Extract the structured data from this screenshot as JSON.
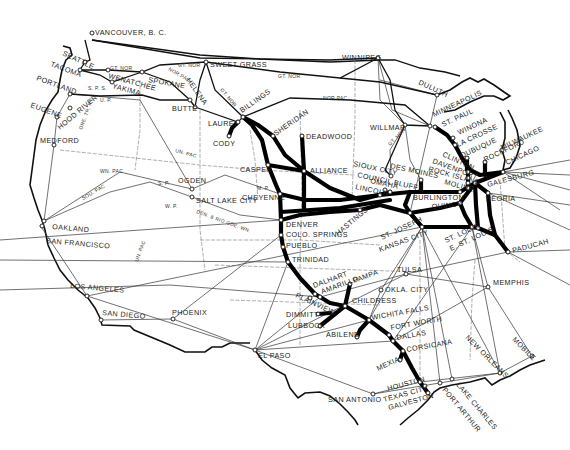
{
  "map": {
    "type": "railroad route map",
    "region": "United States",
    "cities": [
      {
        "id": "vancouver",
        "label": "VANCOUVER, B. C.",
        "x": 92,
        "y": 33,
        "lx": 95,
        "ly": 35,
        "rot": 0
      },
      {
        "id": "seattle",
        "label": "SEATTLE",
        "x": 85,
        "y": 62,
        "lx": 62,
        "ly": 55,
        "rot": 25
      },
      {
        "id": "tacoma",
        "label": "TACOMA",
        "x": 80,
        "y": 70,
        "lx": 50,
        "ly": 66,
        "rot": 20
      },
      {
        "id": "portland",
        "label": "PORTLAND",
        "x": 70,
        "y": 94,
        "lx": 36,
        "ly": 80,
        "rot": 20
      },
      {
        "id": "eugene",
        "label": "EUGENE",
        "x": 57,
        "y": 117,
        "lx": 30,
        "ly": 107,
        "rot": 20
      },
      {
        "id": "hood_river",
        "label": "HOOD RIVER",
        "x": 70,
        "y": 108,
        "lx": 60,
        "ly": 130,
        "rot": -40
      },
      {
        "id": "medford",
        "label": "MEDFORD",
        "x": 54,
        "y": 145,
        "lx": 40,
        "ly": 143,
        "rot": 0
      },
      {
        "id": "wenatchee",
        "label": "WENATCHEE",
        "x": 108,
        "y": 70,
        "lx": 108,
        "ly": 78,
        "rot": 15
      },
      {
        "id": "yakima",
        "label": "YAKIMA",
        "x": 112,
        "y": 82,
        "lx": 112,
        "ly": 88,
        "rot": 15
      },
      {
        "id": "spokane",
        "label": "SPOKANE",
        "x": 142,
        "y": 72,
        "lx": 148,
        "ly": 82,
        "rot": 10
      },
      {
        "id": "helena",
        "label": "HELENA",
        "x": 190,
        "y": 100,
        "lx": 186,
        "ly": 80,
        "rot": 55
      },
      {
        "id": "butte",
        "label": "BUTTE",
        "x": 195,
        "y": 107,
        "lx": 172,
        "ly": 111,
        "rot": 0
      },
      {
        "id": "sweet_grass",
        "label": "SWEET GRASS",
        "x": 206,
        "y": 62,
        "lx": 210,
        "ly": 67,
        "rot": 0
      },
      {
        "id": "billings",
        "label": "BILLINGS",
        "x": 243,
        "y": 117,
        "lx": 242,
        "ly": 113,
        "rot": -35
      },
      {
        "id": "laurel",
        "label": "LAUREL",
        "x": 238,
        "y": 122,
        "lx": 208,
        "ly": 126,
        "rot": 0
      },
      {
        "id": "cody",
        "label": "CODY",
        "x": 229,
        "y": 136,
        "lx": 213,
        "ly": 146,
        "rot": 0
      },
      {
        "id": "sheridan",
        "label": "SHERIDAN",
        "x": 273,
        "y": 136,
        "lx": 276,
        "ly": 136,
        "rot": -35
      },
      {
        "id": "deadwood",
        "label": "DEADWOOD",
        "x": 302,
        "y": 136,
        "lx": 306,
        "ly": 139,
        "rot": 0
      },
      {
        "id": "winnipeg",
        "label": "WINNIPEG",
        "x": 378,
        "y": 58,
        "lx": 342,
        "ly": 60,
        "rot": 0
      },
      {
        "id": "duluth",
        "label": "DULUTH",
        "x": 437,
        "y": 95,
        "lx": 418,
        "ly": 84,
        "rot": 25
      },
      {
        "id": "willmar",
        "label": "WILLMAR",
        "x": 405,
        "y": 125,
        "lx": 370,
        "ly": 130,
        "rot": 0
      },
      {
        "id": "minneapolis",
        "label": "MINNEAPOLIS",
        "x": 430,
        "y": 126,
        "lx": 434,
        "ly": 117,
        "rot": -25
      },
      {
        "id": "st_paul",
        "label": "ST. PAUL",
        "x": 435,
        "y": 127,
        "lx": 443,
        "ly": 127,
        "rot": -25
      },
      {
        "id": "winona",
        "label": "WINONA",
        "x": 453,
        "y": 138,
        "lx": 459,
        "ly": 135,
        "rot": -25
      },
      {
        "id": "la_crosse",
        "label": "LA CROSSE",
        "x": 455,
        "y": 145,
        "lx": 458,
        "ly": 147,
        "rot": -25
      },
      {
        "id": "milwaukee",
        "label": "MILWAUKEE",
        "x": 502,
        "y": 150,
        "lx": 502,
        "ly": 150,
        "rot": -25
      },
      {
        "id": "dubuque",
        "label": "DUBUQUE",
        "x": 467,
        "y": 158,
        "lx": 462,
        "ly": 158,
        "rot": -25
      },
      {
        "id": "rockford",
        "label": "ROCKFORD",
        "x": 485,
        "y": 162,
        "lx": 485,
        "ly": 162,
        "rot": -25
      },
      {
        "id": "chicago",
        "label": "CHICAGO",
        "x": 503,
        "y": 172,
        "lx": 507,
        "ly": 165,
        "rot": -25
      },
      {
        "id": "clinton",
        "label": "CLINTON",
        "x": 468,
        "y": 172,
        "lx": 442,
        "ly": 156,
        "rot": 25
      },
      {
        "id": "davenport",
        "label": "DAVENPORT",
        "x": 468,
        "y": 178,
        "lx": 432,
        "ly": 163,
        "rot": 20
      },
      {
        "id": "rock_island",
        "label": "ROCK ISLAND",
        "x": 468,
        "y": 183,
        "lx": 428,
        "ly": 171,
        "rot": 15
      },
      {
        "id": "moline",
        "label": "MOLINE",
        "x": 468,
        "y": 188,
        "lx": 444,
        "ly": 184,
        "rot": 15
      },
      {
        "id": "galesburg",
        "label": "GALESBURG",
        "x": 475,
        "y": 183,
        "lx": 488,
        "ly": 187,
        "rot": -15
      },
      {
        "id": "peoria",
        "label": "PEORIA",
        "x": 488,
        "y": 193,
        "lx": 486,
        "ly": 201,
        "rot": 0
      },
      {
        "id": "burlington",
        "label": "BURLINGTON",
        "x": 460,
        "y": 192,
        "lx": 413,
        "ly": 200,
        "rot": 0
      },
      {
        "id": "quincy",
        "label": "QUINCY",
        "x": 460,
        "y": 203,
        "lx": 432,
        "ly": 209,
        "rot": -5
      },
      {
        "id": "des_moines",
        "label": "DES MOINES",
        "x": 421,
        "y": 180,
        "lx": 390,
        "ly": 168,
        "rot": 12
      },
      {
        "id": "sioux_city",
        "label": "SIOUX CITY",
        "x": 391,
        "y": 176,
        "lx": 353,
        "ly": 166,
        "rot": 12
      },
      {
        "id": "council_bluffs",
        "label": "COUNCIL BLUFFS",
        "x": 385,
        "y": 190,
        "lx": 357,
        "ly": 177,
        "rot": 12
      },
      {
        "id": "omaha",
        "label": "OMAHA",
        "x": 390,
        "y": 192,
        "lx": 370,
        "ly": 183,
        "rot": 12
      },
      {
        "id": "lincoln",
        "label": "LINCOLN",
        "x": 380,
        "y": 195,
        "lx": 355,
        "ly": 189,
        "rot": 12
      },
      {
        "id": "alliance",
        "label": "ALLIANCE",
        "x": 304,
        "y": 171,
        "lx": 310,
        "ly": 173,
        "rot": 0
      },
      {
        "id": "casper",
        "label": "CASPER",
        "x": 268,
        "y": 165,
        "lx": 240,
        "ly": 172,
        "rot": 0
      },
      {
        "id": "cheyenne",
        "label": "CHEYENNE",
        "x": 280,
        "y": 194,
        "lx": 242,
        "ly": 200,
        "rot": 0
      },
      {
        "id": "ogden",
        "label": "OGDEN",
        "x": 192,
        "y": 189,
        "lx": 178,
        "ly": 183,
        "rot": 0
      },
      {
        "id": "salt_lake_city",
        "label": "SALT LAKE CITY",
        "x": 192,
        "y": 197,
        "lx": 196,
        "ly": 203,
        "rot": 0
      },
      {
        "id": "hastings",
        "label": "HASTINGS",
        "x": 360,
        "y": 210,
        "lx": 338,
        "ly": 236,
        "rot": -40
      },
      {
        "id": "denver",
        "label": "DENVER",
        "x": 281,
        "y": 220,
        "lx": 286,
        "ly": 227,
        "rot": 0
      },
      {
        "id": "colo_springs",
        "label": "COLO. SPRINGS",
        "x": 281,
        "y": 235,
        "lx": 286,
        "ly": 237,
        "rot": 0
      },
      {
        "id": "pueblo",
        "label": "PUEBLO",
        "x": 283,
        "y": 247,
        "lx": 286,
        "ly": 248,
        "rot": 0
      },
      {
        "id": "trinidad",
        "label": "TRINIDAD",
        "x": 288,
        "y": 262,
        "lx": 292,
        "ly": 262,
        "rot": 0
      },
      {
        "id": "st_joseph",
        "label": "ST. JOSEPH",
        "x": 410,
        "y": 213,
        "lx": 382,
        "ly": 240,
        "rot": -25
      },
      {
        "id": "kansas_city",
        "label": "KANSAS CITY",
        "x": 422,
        "y": 227,
        "lx": 380,
        "ly": 252,
        "rot": -20
      },
      {
        "id": "st_louis",
        "label": "ST. LOUIS",
        "x": 472,
        "y": 227,
        "lx": 446,
        "ly": 243,
        "rot": -25
      },
      {
        "id": "e_st_louis",
        "label": "E. ST. LOUIS",
        "x": 478,
        "y": 228,
        "lx": 451,
        "ly": 251,
        "rot": -25
      },
      {
        "id": "paducah",
        "label": "PADUCAH",
        "x": 508,
        "y": 252,
        "lx": 513,
        "ly": 253,
        "rot": -15
      },
      {
        "id": "memphis",
        "label": "MEMPHIS",
        "x": 488,
        "y": 287,
        "lx": 493,
        "ly": 285,
        "rot": 0
      },
      {
        "id": "tulsa",
        "label": "TULSA",
        "x": 406,
        "y": 274,
        "lx": 397,
        "ly": 272,
        "rot": 0
      },
      {
        "id": "okla_city",
        "label": "OKLA. CITY",
        "x": 381,
        "y": 290,
        "lx": 385,
        "ly": 292,
        "rot": 0
      },
      {
        "id": "oakland",
        "label": "OAKLAND",
        "x": 44,
        "y": 221,
        "lx": 52,
        "ly": 229,
        "rot": 5
      },
      {
        "id": "san_francisco",
        "label": "SAN FRANCISCO",
        "x": 42,
        "y": 226,
        "lx": 46,
        "ly": 243,
        "rot": 5
      },
      {
        "id": "los_angeles",
        "label": "LOS ANGELES",
        "x": 87,
        "y": 296,
        "lx": 70,
        "ly": 288,
        "rot": 5
      },
      {
        "id": "san_diego",
        "label": "SAN DIEGO",
        "x": 101,
        "y": 320,
        "lx": 102,
        "ly": 315,
        "rot": 5
      },
      {
        "id": "phoenix",
        "label": "PHOENIX",
        "x": 173,
        "y": 319,
        "lx": 172,
        "ly": 315,
        "rot": 0
      },
      {
        "id": "el_paso",
        "label": "EL PASO",
        "x": 255,
        "y": 350,
        "lx": 258,
        "ly": 358,
        "rot": 0
      },
      {
        "id": "dalhart",
        "label": "DALHART",
        "x": 315,
        "y": 294,
        "lx": 314,
        "ly": 288,
        "rot": -20
      },
      {
        "id": "amarillo",
        "label": "AMARILLO",
        "x": 320,
        "y": 297,
        "lx": 322,
        "ly": 294,
        "rot": -20
      },
      {
        "id": "pampa",
        "label": "PAMPA",
        "x": 350,
        "y": 284,
        "lx": 354,
        "ly": 283,
        "rot": -20
      },
      {
        "id": "plainview",
        "label": "PLAINVIEW",
        "x": 310,
        "y": 298,
        "lx": 295,
        "ly": 297,
        "rot": 25
      },
      {
        "id": "childress",
        "label": "CHILDRESS",
        "x": 345,
        "y": 306,
        "lx": 352,
        "ly": 303,
        "rot": 0
      },
      {
        "id": "dimmitt",
        "label": "DIMMITT",
        "x": 318,
        "y": 314,
        "lx": 286,
        "ly": 317,
        "rot": 0
      },
      {
        "id": "lubbock",
        "label": "LUBBOCK",
        "x": 320,
        "y": 326,
        "lx": 288,
        "ly": 328,
        "rot": 0
      },
      {
        "id": "wichita_falls",
        "label": "WICHITA FALLS",
        "x": 369,
        "y": 320,
        "lx": 372,
        "ly": 320,
        "rot": -10
      },
      {
        "id": "abilene",
        "label": "ABILENE",
        "x": 357,
        "y": 337,
        "lx": 326,
        "ly": 337,
        "rot": 0
      },
      {
        "id": "fort_worth",
        "label": "FORT WORTH",
        "x": 389,
        "y": 335,
        "lx": 391,
        "ly": 330,
        "rot": -10
      },
      {
        "id": "dallas",
        "label": "DALLAS",
        "x": 393,
        "y": 341,
        "lx": 397,
        "ly": 340,
        "rot": -10
      },
      {
        "id": "corsicana",
        "label": "CORSICANA",
        "x": 403,
        "y": 351,
        "lx": 407,
        "ly": 352,
        "rot": -10
      },
      {
        "id": "mexia",
        "label": "MEXIA",
        "x": 400,
        "y": 360,
        "lx": 378,
        "ly": 371,
        "rot": -25
      },
      {
        "id": "houston",
        "label": "HOUSTON",
        "x": 420,
        "y": 382,
        "lx": 388,
        "ly": 391,
        "rot": -15
      },
      {
        "id": "texas_city",
        "label": "TEXAS CITY",
        "x": 425,
        "y": 386,
        "lx": 384,
        "ly": 402,
        "rot": -15
      },
      {
        "id": "galveston",
        "label": "GALVESTON",
        "x": 428,
        "y": 393,
        "lx": 389,
        "ly": 410,
        "rot": -15
      },
      {
        "id": "port_arthur",
        "label": "PORT ARTHUR",
        "x": 440,
        "y": 383,
        "lx": 442,
        "ly": 390,
        "rot": 50
      },
      {
        "id": "lake_charles",
        "label": "LAKE CHARLES",
        "x": 452,
        "y": 379,
        "lx": 456,
        "ly": 385,
        "rot": 50
      },
      {
        "id": "san_antonio",
        "label": "SAN ANTONIO",
        "x": 373,
        "y": 394,
        "lx": 328,
        "ly": 402,
        "rot": 0
      },
      {
        "id": "new_orleans",
        "label": "NEW ORLEANS",
        "x": 500,
        "y": 373,
        "lx": 465,
        "ly": 338,
        "rot": 45
      },
      {
        "id": "mobile",
        "label": "MOBILE",
        "x": 532,
        "y": 356,
        "lx": 512,
        "ly": 340,
        "rot": 45
      }
    ],
    "railroad_labels": [
      {
        "text": "GT. NOR",
        "x": 110,
        "y": 70,
        "rot": 0
      },
      {
        "text": "GT. NOR",
        "x": 178,
        "y": 67,
        "rot": 0
      },
      {
        "text": "NOR PAC",
        "x": 168,
        "y": 70,
        "rot": 30
      },
      {
        "text": "GT. NOR",
        "x": 220,
        "y": 90,
        "rot": 50
      },
      {
        "text": "GT. NOR",
        "x": 278,
        "y": 78,
        "rot": 0
      },
      {
        "text": "NOR PAC",
        "x": 323,
        "y": 100,
        "rot": 0
      },
      {
        "text": "S. P. S.",
        "x": 88,
        "y": 90,
        "rot": 0
      },
      {
        "text": "U. P.",
        "x": 100,
        "y": 102,
        "rot": 0
      },
      {
        "text": "ORE. TR. RY.",
        "x": 82,
        "y": 130,
        "rot": -70
      },
      {
        "text": "UN. PAC",
        "x": 175,
        "y": 152,
        "rot": 15
      },
      {
        "text": "WN. PAC",
        "x": 100,
        "y": 173,
        "rot": 0
      },
      {
        "text": "SOU. PAC",
        "x": 83,
        "y": 200,
        "rot": -30
      },
      {
        "text": "W. P.",
        "x": 165,
        "y": 208,
        "rot": 0
      },
      {
        "text": "S. P.",
        "x": 158,
        "y": 185,
        "rot": 0
      },
      {
        "text": "M. P.",
        "x": 257,
        "y": 190,
        "rot": 0
      },
      {
        "text": "DEN. & RIO GDE. WN.",
        "x": 196,
        "y": 213,
        "rot": 20
      },
      {
        "text": "UN. PAC",
        "x": 138,
        "y": 262,
        "rot": -70
      },
      {
        "text": "GT. NOR",
        "x": 390,
        "y": 146,
        "rot": -45
      }
    ]
  }
}
